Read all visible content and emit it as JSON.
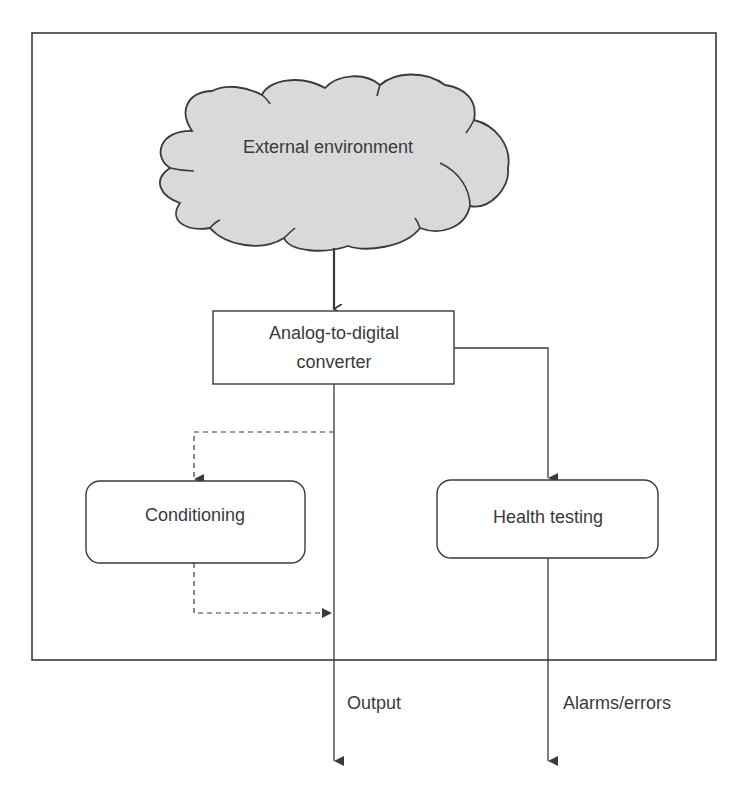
{
  "diagram": {
    "type": "flow",
    "colors": {
      "stroke": "#3a3a3a",
      "cloud_fill": "#d9d9d9",
      "text": "#3a3a3a",
      "background": "#ffffff"
    },
    "nodes": {
      "external_environment": {
        "label": "External environment",
        "shape": "cloud"
      },
      "adc": {
        "label_line1": "Analog-to-digital",
        "label_line2": "converter",
        "shape": "rectangle"
      },
      "conditioning": {
        "label": "Conditioning",
        "shape": "rounded-rectangle"
      },
      "health_testing": {
        "label": "Health testing",
        "shape": "rounded-rectangle"
      }
    },
    "outputs": {
      "output": {
        "label": "Output"
      },
      "alarms": {
        "label": "Alarms/errors"
      }
    },
    "edges": [
      {
        "from": "external_environment",
        "to": "adc",
        "style": "solid"
      },
      {
        "from": "adc",
        "to": "health_testing",
        "style": "solid"
      },
      {
        "from": "adc",
        "to": "conditioning",
        "style": "dashed"
      },
      {
        "from": "conditioning",
        "to": "output",
        "style": "dashed"
      },
      {
        "from": "adc",
        "to": "output",
        "style": "solid"
      },
      {
        "from": "health_testing",
        "to": "alarms",
        "style": "solid"
      }
    ]
  }
}
